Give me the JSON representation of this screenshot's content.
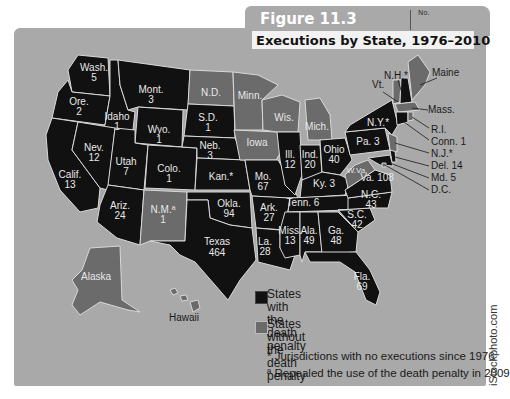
{
  "header": {
    "figure_label": "Figure 11.3",
    "tab_no": "No.",
    "title": "Executions by State, 1976–2010"
  },
  "colors": {
    "with_death_penalty": "#111111",
    "without_death_penalty": "#6b6b6b",
    "background": "#a9a9a9",
    "border": "#d8d8d8"
  },
  "states": [
    {
      "abbr": "Wash.",
      "value": "5",
      "status": "with"
    },
    {
      "abbr": "Ore.",
      "value": "2",
      "status": "with"
    },
    {
      "abbr": "Calif.",
      "value": "13",
      "status": "with"
    },
    {
      "abbr": "Idaho",
      "value": "1",
      "status": "with"
    },
    {
      "abbr": "Nev.",
      "value": "12",
      "status": "with"
    },
    {
      "abbr": "Mont.",
      "value": "3",
      "status": "with"
    },
    {
      "abbr": "Wyo.",
      "value": "1",
      "status": "with"
    },
    {
      "abbr": "Utah",
      "value": "7",
      "status": "with"
    },
    {
      "abbr": "Colo.",
      "value": "1",
      "status": "with"
    },
    {
      "abbr": "Ariz.",
      "value": "24",
      "status": "with"
    },
    {
      "abbr": "N.M.ª",
      "value": "1",
      "status": "without"
    },
    {
      "abbr": "N.D.",
      "value": "",
      "status": "without"
    },
    {
      "abbr": "S.D.",
      "value": "1",
      "status": "with"
    },
    {
      "abbr": "Neb.",
      "value": "3",
      "status": "with"
    },
    {
      "abbr": "Kan.*",
      "value": "",
      "status": "with"
    },
    {
      "abbr": "Okla.",
      "value": "94",
      "status": "with"
    },
    {
      "abbr": "Texas",
      "value": "464",
      "status": "with"
    },
    {
      "abbr": "Minn.",
      "value": "",
      "status": "without"
    },
    {
      "abbr": "Iowa",
      "value": "",
      "status": "without"
    },
    {
      "abbr": "Mo.",
      "value": "67",
      "status": "with"
    },
    {
      "abbr": "Ark.",
      "value": "27",
      "status": "with"
    },
    {
      "abbr": "La.",
      "value": "28",
      "status": "with"
    },
    {
      "abbr": "Wis.",
      "value": "",
      "status": "without"
    },
    {
      "abbr": "Ill.",
      "value": "12",
      "status": "with"
    },
    {
      "abbr": "Mich.",
      "value": "",
      "status": "without"
    },
    {
      "abbr": "Ind.",
      "value": "20",
      "status": "with"
    },
    {
      "abbr": "Ohio",
      "value": "40",
      "status": "with"
    },
    {
      "abbr": "Ky.",
      "value": "3",
      "status": "with"
    },
    {
      "abbr": "Tenn.",
      "value": "6",
      "status": "with"
    },
    {
      "abbr": "Miss.",
      "value": "13",
      "status": "with"
    },
    {
      "abbr": "Ala.",
      "value": "49",
      "status": "with"
    },
    {
      "abbr": "Ga.",
      "value": "48",
      "status": "with"
    },
    {
      "abbr": "Fla.",
      "value": "69",
      "status": "with"
    },
    {
      "abbr": "S.C.",
      "value": "42",
      "status": "with"
    },
    {
      "abbr": "N.C.",
      "value": "43",
      "status": "with"
    },
    {
      "abbr": "Va.",
      "value": "108",
      "status": "with"
    },
    {
      "abbr": "W.Va.",
      "value": "",
      "status": "without"
    },
    {
      "abbr": "Pa.",
      "value": "3",
      "status": "with"
    },
    {
      "abbr": "N.Y.*",
      "value": "",
      "status": "with"
    },
    {
      "abbr": "Vt.",
      "value": "",
      "status": "without"
    },
    {
      "abbr": "N.H.*",
      "value": "",
      "status": "with"
    },
    {
      "abbr": "Maine",
      "value": "",
      "status": "without"
    },
    {
      "abbr": "Mass.",
      "value": "",
      "status": "without"
    },
    {
      "abbr": "R.I.",
      "value": "",
      "status": "without"
    },
    {
      "abbr": "Conn.",
      "value": "1",
      "status": "with"
    },
    {
      "abbr": "N.J.*",
      "value": "",
      "status": "without"
    },
    {
      "abbr": "Del.",
      "value": "14",
      "status": "with"
    },
    {
      "abbr": "Md.",
      "value": "5",
      "status": "with"
    },
    {
      "abbr": "D.C.",
      "value": "",
      "status": "without"
    },
    {
      "abbr": "Alaska",
      "value": "",
      "status": "without"
    },
    {
      "abbr": "Hawaii",
      "value": "",
      "status": "without"
    }
  ],
  "labels": {
    "wash": "Wash.",
    "wash_v": "5",
    "ore": "Ore.",
    "ore_v": "2",
    "calif": "Calif.",
    "calif_v": "13",
    "idaho": "Idaho",
    "idaho_v": "1",
    "nev": "Nev.",
    "nev_v": "12",
    "mont": "Mont.",
    "mont_v": "3",
    "wyo": "Wyo.",
    "wyo_v": "1",
    "utah": "Utah",
    "utah_v": "7",
    "colo": "Colo.",
    "colo_v": "1",
    "ariz": "Ariz.",
    "ariz_v": "24",
    "nm": "N.M.ª",
    "nm_v": "1",
    "nd": "N.D.",
    "sd": "S.D.",
    "sd_v": "1",
    "neb": "Neb.",
    "neb_v": "3",
    "kan": "Kan.*",
    "okla": "Okla.",
    "okla_v": "94",
    "texas": "Texas",
    "texas_v": "464",
    "minn": "Minn.",
    "iowa": "Iowa",
    "mo": "Mo.",
    "mo_v": "67",
    "ark": "Ark.",
    "ark_v": "27",
    "la": "La.",
    "la_v": "28",
    "wis": "Wis.",
    "ill": "Ill.",
    "ill_v": "12",
    "mich": "Mich.",
    "ind": "Ind.",
    "ind_v": "20",
    "ohio": "Ohio",
    "ohio_v": "40",
    "ky": "Ky. 3",
    "tenn": "Tenn. 6",
    "miss": "Miss.",
    "miss_v": "13",
    "ala": "Ala.",
    "ala_v": "49",
    "ga": "Ga.",
    "ga_v": "48",
    "fla": "Fla.",
    "fla_v": "69",
    "sc": "S.C.",
    "sc_v": "42",
    "nc": "N.C.",
    "nc_v": "43",
    "va": "Va. 108",
    "wva": "W.Va.",
    "pa": "Pa. 3",
    "ny": "N.Y.*",
    "vt": "Vt.",
    "nh": "N.H.*",
    "maine": "Maine",
    "mass": "Mass.",
    "ri": "R.I.",
    "conn": "Conn. 1",
    "nj": "N.J.*",
    "del": "Del. 14",
    "md": "Md. 5",
    "dc": "D.C.",
    "alaska": "Alaska",
    "hawaii": "Hawaii"
  },
  "legend": {
    "with_label_1": "States with the",
    "with_label_2": "death penalty",
    "without_label_1": "States without",
    "without_label_2": "the death penalty",
    "note_star": "* Jurisdictions with no executions since 1976",
    "note_a": "ª Repealed the use of the death penalty in 2009"
  },
  "credit": "iStockphoto.com"
}
